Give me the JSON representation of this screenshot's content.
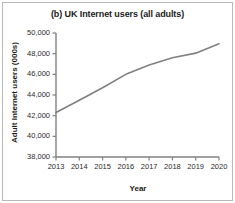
{
  "chart_data": {
    "type": "line",
    "title": "(b) UK Internet users (all adults)",
    "xlabel": "Year",
    "ylabel": "Adult Internet users (000s)",
    "categories": [
      "2013",
      "2014",
      "2015",
      "2016",
      "2017",
      "2018",
      "2019",
      "2020"
    ],
    "x": [
      2013,
      2014,
      2015,
      2016,
      2017,
      2018,
      2019,
      2020
    ],
    "values": [
      42300,
      43500,
      44700,
      46000,
      46900,
      47600,
      48050,
      48950
    ],
    "series": [
      {
        "name": "Adult Internet users",
        "values": [
          42300,
          43500,
          44700,
          46000,
          46900,
          47600,
          48050,
          48950
        ]
      }
    ],
    "ylim": [
      38000,
      50000
    ],
    "xlim": [
      2013,
      2020
    ],
    "ytick_labels": [
      "50,000",
      "48,000",
      "46,000",
      "44,000",
      "42,000",
      "40,000",
      "38,000"
    ],
    "ytick_values": [
      50000,
      48000,
      46000,
      44000,
      42000,
      40000,
      38000
    ],
    "xtick_labels": [
      "2013",
      "2014",
      "2015",
      "2016",
      "2017",
      "2018",
      "2019",
      "2020"
    ],
    "grid": false,
    "legend": false,
    "line_color": "#808080",
    "axis_color": "#808080"
  },
  "axes": {
    "y_title": "Adult Internet users (000s)",
    "x_title": "Year"
  },
  "title": {
    "text": "(b) UK Internet users (all adults)"
  }
}
